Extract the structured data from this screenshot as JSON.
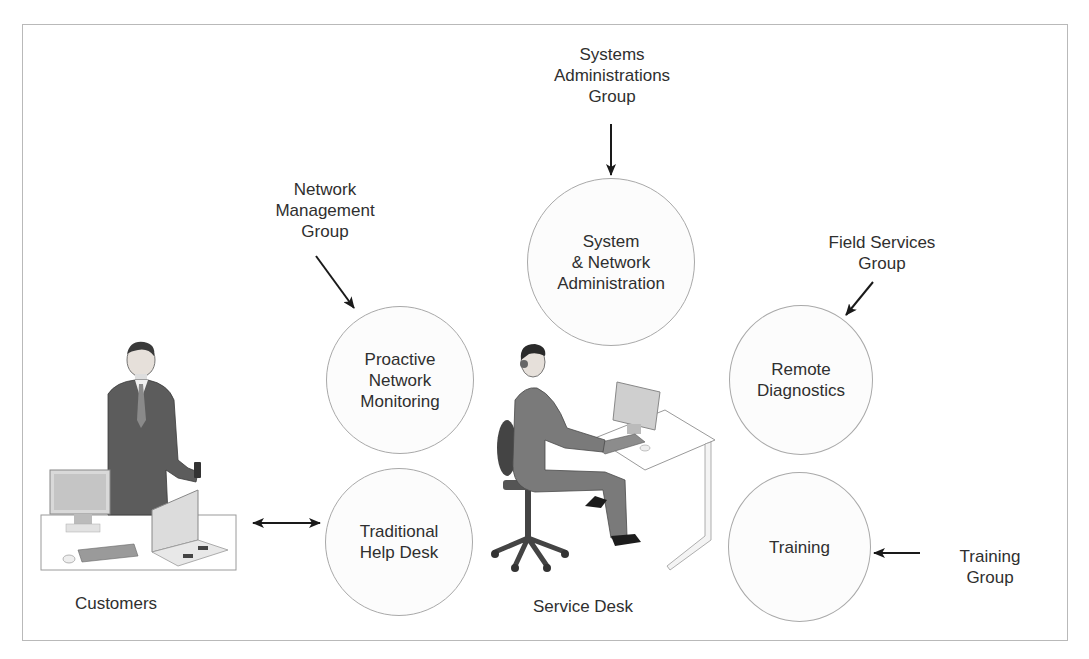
{
  "diagram": {
    "type": "service-desk-overview",
    "circles": [
      {
        "id": "system-network-administration",
        "label": "System\n& Network\nAdministration"
      },
      {
        "id": "proactive-network-monitoring",
        "label": "Proactive\nNetwork\nMonitoring"
      },
      {
        "id": "traditional-help-desk",
        "label": "Traditional\nHelp Desk"
      },
      {
        "id": "remote-diagnostics",
        "label": "Remote\nDiagnostics"
      },
      {
        "id": "training",
        "label": "Training"
      }
    ],
    "groups": [
      {
        "id": "systems-administrations-group",
        "label": "Systems\nAdministrations\nGroup",
        "points_to": "system-network-administration"
      },
      {
        "id": "network-management-group",
        "label": "Network\nManagement\nGroup",
        "points_to": "proactive-network-monitoring"
      },
      {
        "id": "field-services-group",
        "label": "Field Services\nGroup",
        "points_to": "remote-diagnostics"
      },
      {
        "id": "training-group",
        "label": "Training Group",
        "points_to": "training"
      }
    ],
    "figures": [
      {
        "id": "customers",
        "label": "Customers",
        "connection": "bidirectional with traditional-help-desk"
      },
      {
        "id": "service-desk",
        "label": "Service Desk"
      }
    ],
    "colors": {
      "circle_border": "#a9a9a9",
      "arrow": "#1a1a1a",
      "text": "#2f2f2f",
      "frame": "#b9b9b9"
    }
  }
}
